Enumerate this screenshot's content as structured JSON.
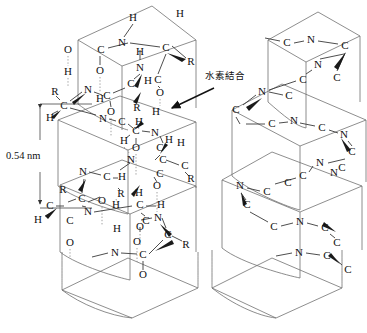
{
  "figure": {
    "type": "molecular-diagram",
    "panels": [
      {
        "id": "detailed",
        "description": "detailed backbone with atoms and hydrogen bonds"
      },
      {
        "id": "simplified",
        "description": "simplified backbone showing C and N only"
      }
    ]
  },
  "annotations": {
    "hydrogen_bond_label": "水素結合",
    "pitch_label": "0.54 nm"
  },
  "atom_labels": {
    "carbon": "C",
    "nitrogen": "N",
    "oxygen": "O",
    "hydrogen": "H",
    "sidechain": "R"
  },
  "colors": {
    "ink": "#111111",
    "bond": "#3a3a3a",
    "hbond": "#8a8a8a",
    "ribbon_light": "#f2f2f2",
    "ribbon_mid": "#c9c9c9",
    "ribbon_dark": "#8d8d8d",
    "background": "#ffffff"
  },
  "left_panel": {
    "atoms": [
      {
        "t": "H",
        "x": 133,
        "y": 18
      },
      {
        "t": "H",
        "x": 180,
        "y": 14
      },
      {
        "t": "N",
        "x": 122,
        "y": 43
      },
      {
        "t": "H",
        "x": 140,
        "y": 52
      },
      {
        "t": "C",
        "x": 101,
        "y": 50
      },
      {
        "t": "O",
        "x": 68,
        "y": 50
      },
      {
        "t": "C",
        "x": 166,
        "y": 48
      },
      {
        "t": "R",
        "x": 191,
        "y": 62
      },
      {
        "t": "O",
        "x": 100,
        "y": 71
      },
      {
        "t": "N",
        "x": 140,
        "y": 68
      },
      {
        "t": "H",
        "x": 68,
        "y": 72
      },
      {
        "t": "C",
        "x": 131,
        "y": 84
      },
      {
        "t": "H",
        "x": 148,
        "y": 81
      },
      {
        "t": "C",
        "x": 158,
        "y": 80
      },
      {
        "t": "O",
        "x": 160,
        "y": 93
      },
      {
        "t": "R",
        "x": 55,
        "y": 92
      },
      {
        "t": "N",
        "x": 88,
        "y": 90
      },
      {
        "t": "C",
        "x": 107,
        "y": 96
      },
      {
        "t": "H",
        "x": 100,
        "y": 99
      },
      {
        "t": "C",
        "x": 64,
        "y": 106
      },
      {
        "t": "H",
        "x": 50,
        "y": 118
      },
      {
        "t": "O",
        "x": 111,
        "y": 112
      },
      {
        "t": "R",
        "x": 137,
        "y": 108
      },
      {
        "t": "H",
        "x": 156,
        "y": 112
      },
      {
        "t": "N",
        "x": 103,
        "y": 119
      },
      {
        "t": "C",
        "x": 122,
        "y": 122
      },
      {
        "t": "H",
        "x": 139,
        "y": 122
      },
      {
        "t": "C",
        "x": 136,
        "y": 131
      },
      {
        "t": "N",
        "x": 155,
        "y": 133
      },
      {
        "t": "H",
        "x": 169,
        "y": 140
      },
      {
        "t": "H",
        "x": 124,
        "y": 141
      },
      {
        "t": "O",
        "x": 136,
        "y": 148
      },
      {
        "t": "C",
        "x": 160,
        "y": 148
      },
      {
        "t": "H",
        "x": 181,
        "y": 143
      },
      {
        "t": "N",
        "x": 131,
        "y": 160
      },
      {
        "t": "C",
        "x": 163,
        "y": 160
      },
      {
        "t": "C",
        "x": 185,
        "y": 166
      },
      {
        "t": "R",
        "x": 191,
        "y": 179
      },
      {
        "t": "N",
        "x": 83,
        "y": 172
      },
      {
        "t": "C",
        "x": 107,
        "y": 177
      },
      {
        "t": "H",
        "x": 122,
        "y": 177
      },
      {
        "t": "C",
        "x": 160,
        "y": 174
      },
      {
        "t": "O",
        "x": 157,
        "y": 186
      },
      {
        "t": "R",
        "x": 63,
        "y": 190
      },
      {
        "t": "C",
        "x": 82,
        "y": 199
      },
      {
        "t": "O",
        "x": 102,
        "y": 201
      },
      {
        "t": "R",
        "x": 121,
        "y": 194
      },
      {
        "t": "H",
        "x": 139,
        "y": 193
      },
      {
        "t": "C",
        "x": 50,
        "y": 206
      },
      {
        "t": "H",
        "x": 116,
        "y": 205
      },
      {
        "t": "N",
        "x": 88,
        "y": 212
      },
      {
        "t": "C",
        "x": 140,
        "y": 205
      },
      {
        "t": "H",
        "x": 161,
        "y": 205
      },
      {
        "t": "H",
        "x": 38,
        "y": 220
      },
      {
        "t": "C",
        "x": 70,
        "y": 221
      },
      {
        "t": "N",
        "x": 158,
        "y": 218
      },
      {
        "t": "C",
        "x": 146,
        "y": 221
      },
      {
        "t": "O",
        "x": 140,
        "y": 227
      },
      {
        "t": "H",
        "x": 117,
        "y": 229
      },
      {
        "t": "O",
        "x": 70,
        "y": 243
      },
      {
        "t": "C",
        "x": 168,
        "y": 235
      },
      {
        "t": "N",
        "x": 115,
        "y": 253
      },
      {
        "t": "C",
        "x": 143,
        "y": 255
      },
      {
        "t": "R",
        "x": 186,
        "y": 245
      },
      {
        "t": "O",
        "x": 137,
        "y": 242
      },
      {
        "t": "O",
        "x": 143,
        "y": 275
      }
    ]
  },
  "right_panel": {
    "atoms": [
      {
        "t": "C",
        "x": 287,
        "y": 43
      },
      {
        "t": "N",
        "x": 311,
        "y": 40
      },
      {
        "t": "C",
        "x": 345,
        "y": 46
      },
      {
        "t": "N",
        "x": 318,
        "y": 65
      },
      {
        "t": "C",
        "x": 303,
        "y": 80
      },
      {
        "t": "C",
        "x": 337,
        "y": 78
      },
      {
        "t": "N",
        "x": 262,
        "y": 92
      },
      {
        "t": "C",
        "x": 289,
        "y": 96
      },
      {
        "t": "C",
        "x": 236,
        "y": 110
      },
      {
        "t": "C",
        "x": 272,
        "y": 124
      },
      {
        "t": "N",
        "x": 294,
        "y": 121
      },
      {
        "t": "C",
        "x": 322,
        "y": 128
      },
      {
        "t": "N",
        "x": 344,
        "y": 135
      },
      {
        "t": "C",
        "x": 352,
        "y": 152
      },
      {
        "t": "N",
        "x": 320,
        "y": 163
      },
      {
        "t": "C",
        "x": 342,
        "y": 168
      },
      {
        "t": "C",
        "x": 303,
        "y": 176
      },
      {
        "t": "N",
        "x": 334,
        "y": 173
      },
      {
        "t": "N",
        "x": 240,
        "y": 186
      },
      {
        "t": "C",
        "x": 267,
        "y": 192
      },
      {
        "t": "C",
        "x": 288,
        "y": 183
      },
      {
        "t": "C",
        "x": 247,
        "y": 205
      },
      {
        "t": "C",
        "x": 274,
        "y": 227
      },
      {
        "t": "N",
        "x": 300,
        "y": 222
      },
      {
        "t": "C",
        "x": 325,
        "y": 228
      },
      {
        "t": "C",
        "x": 337,
        "y": 243
      },
      {
        "t": "N",
        "x": 299,
        "y": 253
      },
      {
        "t": "C",
        "x": 327,
        "y": 256
      },
      {
        "t": "C",
        "x": 348,
        "y": 270
      }
    ]
  }
}
